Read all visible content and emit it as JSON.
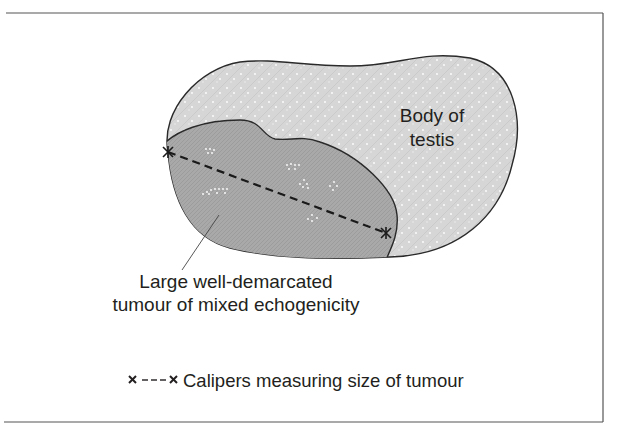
{
  "figure": {
    "type": "ultrasound-schematic",
    "labels": {
      "body_line1": "Body of",
      "body_line2": "testis",
      "tumour_line1": "Large well-demarcated",
      "tumour_line2": "tumour of mixed echogenicity"
    },
    "legend": {
      "symbol": "× - - - ×",
      "text": "Calipers measuring size of tumour"
    },
    "colors": {
      "frame": "#555555",
      "outline": "#2a2a2a",
      "testis_fill": "#d6d6d6",
      "tumour_fill": "#a9a9a9",
      "speckle": "#ffffff",
      "text": "#231f20"
    }
  }
}
